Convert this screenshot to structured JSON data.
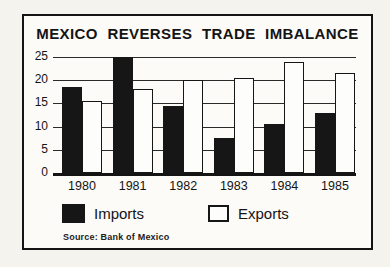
{
  "chart_data": {
    "type": "bar",
    "title": "MEXICO REVERSES TRADE IMBALANCE",
    "categories": [
      "1980",
      "1981",
      "1982",
      "1983",
      "1984",
      "1985"
    ],
    "series": [
      {
        "name": "Imports",
        "color": "#161616",
        "values": [
          18.5,
          25,
          14.5,
          7.5,
          10.5,
          13
        ]
      },
      {
        "name": "Exports",
        "color": "#ffffff",
        "values": [
          15.5,
          18,
          20,
          20.5,
          24,
          21.5
        ]
      }
    ],
    "xlabel": "",
    "ylabel": "",
    "ylim": [
      0,
      25
    ],
    "yticks": [
      0,
      5,
      10,
      15,
      20,
      25
    ],
    "grid": "horizontal",
    "legend_position": "bottom-left",
    "source": "Source: Bank of Mexico"
  },
  "colors": {
    "ink": "#141414",
    "paper": "#fcfbf8",
    "page_background": "#f4f3ee"
  }
}
